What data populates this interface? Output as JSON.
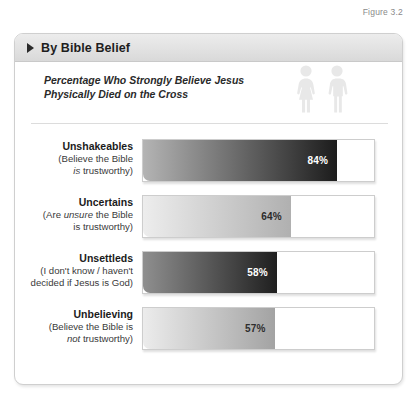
{
  "figure": {
    "caption": "Figure 3.2"
  },
  "card": {
    "header_title": "By Bible Belief",
    "subtitle_line1": "Percentage Who Strongly Believe Jesus",
    "subtitle_line2": "Physically Died on the Cross"
  },
  "icons": {
    "triangle": "triangle-right-icon",
    "female": "female-figure-icon",
    "male": "male-figure-icon"
  },
  "colors": {
    "card_border": "#cfcfcf",
    "header_band": "#e2e2e2",
    "text_dark": "#1b1b1b",
    "track_border": "#cdcdcd"
  },
  "chart_data": {
    "type": "bar",
    "title": "Percentage Who Strongly Believe Jesus Physically Died on the Cross",
    "subtitle": "By Bible Belief",
    "xlabel": "",
    "ylabel": "",
    "xlim": [
      0,
      100
    ],
    "grid": false,
    "legend": "none",
    "orientation": "horizontal",
    "categories": [
      "Unshakeables",
      "Uncertains",
      "Unsettleds",
      "Unbelieving"
    ],
    "values": [
      84,
      64,
      58,
      57
    ],
    "value_labels": [
      "84%",
      "64%",
      "58%",
      "57%"
    ],
    "rows": [
      {
        "title": "Unshakeables",
        "sub_line1_pre": "(Believe the Bible",
        "sub_line1_em": "",
        "sub_line2_em": "is",
        "sub_line2_post": " trustworthy)",
        "value": 84,
        "value_label": "84%",
        "value_text_color": "#ffffff",
        "gradient_from": "#b4b4b4",
        "gradient_to": "#1c1c1c"
      },
      {
        "title": "Uncertains",
        "sub_line1_pre": "(Are ",
        "sub_line1_em": "unsure",
        "sub_line1_post": " the Bible",
        "sub_line2_post": "is trustworthy)",
        "value": 64,
        "value_label": "64%",
        "value_text_color": "#2a2a2a",
        "gradient_from": "#ededed",
        "gradient_to": "#b0b0b0"
      },
      {
        "title": "Unsettleds",
        "sub_line1_pre": "(I don't know / haven't",
        "sub_line2_post": "decided if Jesus is God)",
        "value": 58,
        "value_label": "58%",
        "value_text_color": "#ffffff",
        "gradient_from": "#8f8f8f",
        "gradient_to": "#1f1f1f"
      },
      {
        "title": "Unbelieving",
        "sub_line1_pre": "(Believe the Bible is",
        "sub_line2_em": "not",
        "sub_line2_post": " trustworthy)",
        "value": 57,
        "value_label": "57%",
        "value_text_color": "#2e2e2e",
        "gradient_from": "#ececec",
        "gradient_to": "#a3a3a3"
      }
    ]
  }
}
